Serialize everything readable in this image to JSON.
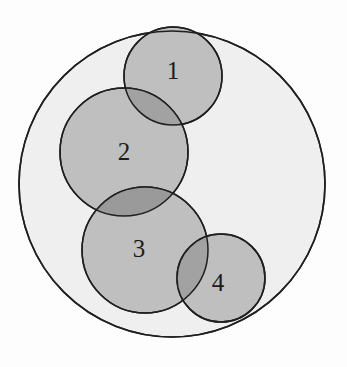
{
  "figure": {
    "canvas": {
      "width": 347,
      "height": 367,
      "background": "#fdfdfd"
    }
  },
  "chart_data": {
    "type": "diagram",
    "subtype": "venn-circles",
    "title": "",
    "xlabel": "",
    "ylabel": "",
    "grid": false,
    "legend": null,
    "universe": {
      "name": "outer-circle",
      "label": "",
      "cx": 172,
      "cy": 184,
      "r": 153,
      "fill": "#efefef",
      "stroke": "#1f1f1f",
      "stroke_width": 1.6
    },
    "circles": [
      {
        "id": 1,
        "label": "1",
        "cx": 173,
        "cy": 76,
        "r": 49,
        "label_x": 173,
        "label_y": 73,
        "fill": "#bfbfbf",
        "stroke": "#1f1f1f"
      },
      {
        "id": 2,
        "label": "2",
        "cx": 124,
        "cy": 152,
        "r": 64,
        "label_x": 124,
        "label_y": 154,
        "fill": "#bfbfbf",
        "stroke": "#1f1f1f"
      },
      {
        "id": 3,
        "label": "3",
        "cx": 145,
        "cy": 250,
        "r": 63,
        "label_x": 139,
        "label_y": 251,
        "fill": "#bfbfbf",
        "stroke": "#1f1f1f"
      },
      {
        "id": 4,
        "label": "4",
        "cx": 221,
        "cy": 278,
        "r": 44,
        "label_x": 218,
        "label_y": 285,
        "fill": "#bfbfbf",
        "stroke": "#1f1f1f"
      }
    ],
    "overlaps": [
      {
        "pair": [
          1,
          2
        ],
        "fill": "#a2a2a2"
      },
      {
        "pair": [
          2,
          3
        ],
        "fill": "#9a9a9a"
      },
      {
        "pair": [
          3,
          4
        ],
        "fill": "#a2a2a2"
      }
    ],
    "colors": {
      "outer_fill": "#efefef",
      "circle_fill": "#bfbfbf",
      "overlap_fill": "#9e9e9e",
      "stroke": "#1f1f1f",
      "label_text": "#1c1c1c",
      "page_background": "#fdfdfd"
    }
  }
}
